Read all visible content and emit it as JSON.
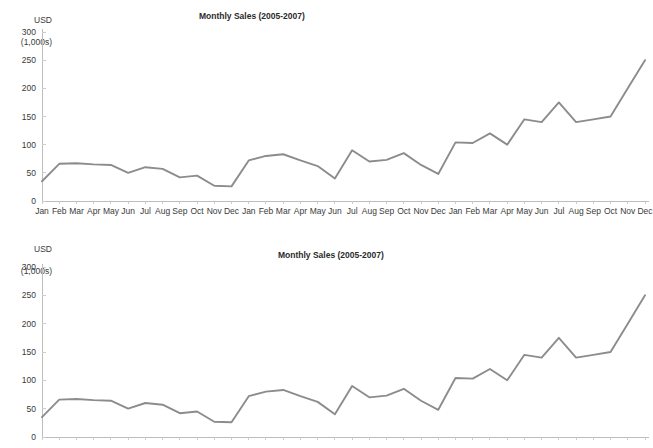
{
  "page": {
    "background_color": "#ffffff",
    "line_color": "#8c8c8c",
    "axis_color": "#bdbdbd",
    "text_color": "#3a3a3a"
  },
  "charts": [
    {
      "id": "chart-top",
      "title": "Monthly Sales (2005-2007)",
      "y_axis_unit_line1": "USD",
      "y_axis_unit_line2": "(1,000s)"
    },
    {
      "id": "chart-bottom",
      "title": "Monthly Sales (2005-2007)",
      "y_axis_unit_line1": "USD",
      "y_axis_unit_line2": "(1,000s)"
    }
  ],
  "chart_data": [
    {
      "type": "line",
      "title": "Monthly Sales (2005-2007)",
      "xlabel": "",
      "ylabel": "USD (1,000s)",
      "ylim": [
        0,
        300
      ],
      "yticks": [
        0,
        50,
        100,
        150,
        200,
        250,
        300
      ],
      "ytick_labels": [
        "0",
        "50",
        "100",
        "150",
        "200",
        "250",
        "300"
      ],
      "grid": false,
      "legend": "none",
      "categories": [
        "Jan",
        "Feb",
        "Mar",
        "Apr",
        "May",
        "Jun",
        "Jul",
        "Aug",
        "Sep",
        "Oct",
        "Nov",
        "Dec",
        "Jan",
        "Feb",
        "Mar",
        "Apr",
        "May",
        "Jun",
        "Jul",
        "Aug",
        "Sep",
        "Oct",
        "Nov",
        "Dec",
        "Jan",
        "Feb",
        "Mar",
        "Apr",
        "May",
        "Jun",
        "Jul",
        "Aug",
        "Sep",
        "Oct",
        "Nov",
        "Dec"
      ],
      "values": [
        35,
        66,
        67,
        65,
        64,
        50,
        60,
        57,
        42,
        45,
        27,
        26,
        72,
        80,
        83,
        72,
        62,
        40,
        90,
        70,
        73,
        85,
        64,
        48,
        104,
        103,
        120,
        100,
        145,
        140,
        175,
        140,
        145,
        150,
        200,
        250
      ]
    },
    {
      "type": "line",
      "title": "Monthly Sales (2005-2007)",
      "xlabel": "",
      "ylabel": "USD (1,000s)",
      "ylim": [
        0,
        300
      ],
      "yticks": [
        0,
        50,
        100,
        150,
        200,
        250,
        300
      ],
      "ytick_labels": [
        "0",
        "50",
        "100",
        "150",
        "200",
        "250",
        "300"
      ],
      "grid": false,
      "legend": "none",
      "categories": [
        "Jan",
        "Feb",
        "Mar",
        "Apr",
        "May",
        "Jun",
        "Jul",
        "Aug",
        "Sep",
        "Oct",
        "Nov",
        "Dec",
        "Jan",
        "Feb",
        "Mar",
        "Apr",
        "May",
        "Jun",
        "Jul",
        "Aug",
        "Sep",
        "Oct",
        "Nov",
        "Dec",
        "Jan",
        "Feb",
        "Mar",
        "Apr",
        "May",
        "Jun",
        "Jul",
        "Aug",
        "Sep",
        "Oct",
        "Nov",
        "Dec"
      ],
      "values": [
        35,
        66,
        67,
        65,
        64,
        50,
        60,
        57,
        42,
        45,
        27,
        26,
        72,
        80,
        83,
        72,
        62,
        40,
        90,
        70,
        73,
        85,
        64,
        48,
        104,
        103,
        120,
        100,
        145,
        140,
        175,
        140,
        145,
        150,
        200,
        250
      ]
    }
  ]
}
